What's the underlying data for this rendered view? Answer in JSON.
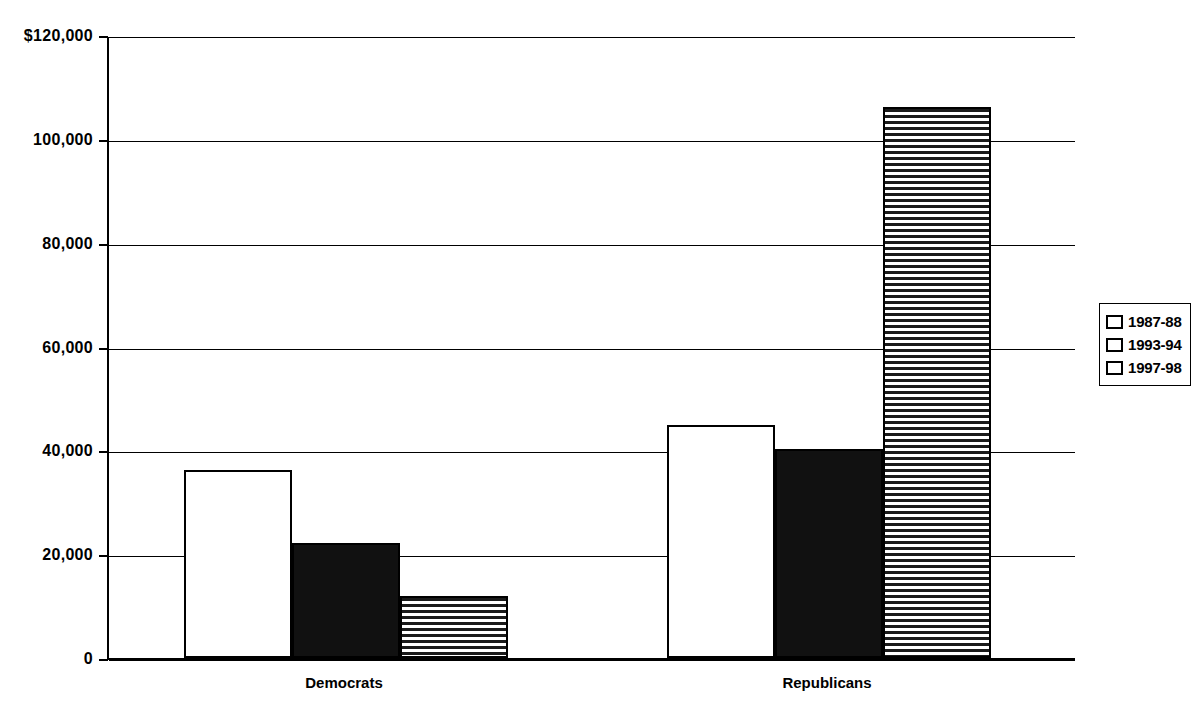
{
  "chart_data": {
    "type": "bar",
    "title": "",
    "subtitle": "",
    "xlabel": "",
    "ylabel": "",
    "categories": [
      "Democrats",
      "Republicans"
    ],
    "series": [
      {
        "name": "1987-88",
        "values": [
          36200,
          44800
        ],
        "fill": "white"
      },
      {
        "name": "1993-94",
        "values": [
          22200,
          40200
        ],
        "fill": "black"
      },
      {
        "name": "1997-98",
        "values": [
          11900,
          106200
        ],
        "fill": "stripe"
      }
    ],
    "ylim": [
      0,
      120000
    ],
    "ytick_values": [
      120000,
      100000,
      80000,
      60000,
      40000,
      20000,
      0
    ],
    "ytick_labels": [
      "$120,000",
      "100,000",
      "80,000",
      "60,000",
      "40,000",
      "20,000",
      "0"
    ],
    "grid": true,
    "grid_axis": "y",
    "legend_position": "right",
    "legend_entries": [
      "1987-88",
      "1993-94",
      "1997-98"
    ],
    "colors": {
      "axis": "#000000",
      "gridline": "#000000",
      "series_1987_88": "#ffffff",
      "series_1993_94": "#111111",
      "series_1997_98": "#1a1a1a",
      "background": "#ffffff"
    }
  },
  "axis": {
    "y_ticks": [
      {
        "label": "$120,000",
        "value": 120000
      },
      {
        "label": "100,000",
        "value": 100000
      },
      {
        "label": "80,000",
        "value": 80000
      },
      {
        "label": "60,000",
        "value": 60000
      },
      {
        "label": "40,000",
        "value": 40000
      },
      {
        "label": "20,000",
        "value": 20000
      },
      {
        "label": "0",
        "value": 0
      }
    ],
    "x_categories": [
      {
        "label": "Democrats"
      },
      {
        "label": "Republicans"
      }
    ]
  },
  "legend": {
    "items": [
      {
        "label": "1987-88",
        "fill": "white"
      },
      {
        "label": "1993-94",
        "fill": "black"
      },
      {
        "label": "1997-98",
        "fill": "stripe"
      }
    ]
  }
}
